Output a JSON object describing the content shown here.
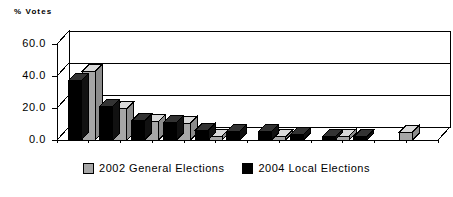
{
  "chart_data": {
    "type": "bar",
    "title": "",
    "subtitle": "",
    "xlabel": "",
    "ylabel": "% Votes",
    "ylim": [
      0,
      60
    ],
    "yticks": [
      "0.0",
      "20.0",
      "40.0",
      "60.0"
    ],
    "ytick_values": [
      0,
      20,
      40,
      60
    ],
    "grid": true,
    "grid_axis": "y",
    "legend_position": "bottom-center",
    "style": "3d-clustered-bar",
    "categories": [
      "1",
      "2",
      "3",
      "4",
      "5",
      "6",
      "7",
      "8",
      "9",
      "10",
      "11"
    ],
    "xtick_labels_visible": false,
    "series": [
      {
        "name": "2004 Local Elections",
        "color": "#000000",
        "values": [
          37.0,
          21.0,
          12.0,
          11.0,
          6.0,
          5.5,
          5.5,
          3.5,
          2.0,
          2.0,
          0.0
        ]
      },
      {
        "name": "2002 General Elections",
        "color": "#a6a6a6",
        "values": [
          43.0,
          19.5,
          11.5,
          10.5,
          2.5,
          0.0,
          2.0,
          0.0,
          2.5,
          0.0,
          5.0
        ]
      }
    ]
  },
  "axis": {
    "y_title": "% Votes"
  },
  "legend": {
    "items": [
      {
        "label": "2002 General Elections",
        "swatch": "gray-swatch"
      },
      {
        "label": "2004 Local Elections",
        "swatch": "black-swatch"
      }
    ]
  }
}
